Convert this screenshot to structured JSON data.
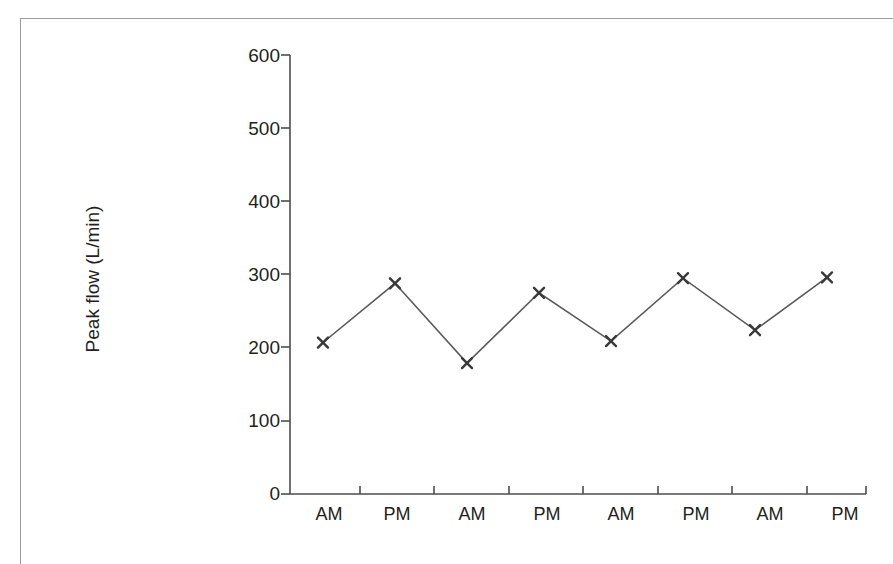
{
  "figure": {
    "ylabel": "Peak flow (L/min)",
    "xlabel": "",
    "title": "",
    "axis_color": "#4d4d4d",
    "series_color": "#595959",
    "marker": "x-cross",
    "frame_color": "#9a9a9a"
  },
  "axes": {
    "y_ticks": [
      "600",
      "500",
      "400",
      "300",
      "200",
      "100",
      "0"
    ],
    "x_ticks": [
      "AM",
      "PM",
      "AM",
      "PM",
      "AM",
      "PM",
      "AM",
      "PM"
    ]
  },
  "chart_data": {
    "type": "line",
    "title": "",
    "xlabel": "",
    "ylabel": "Peak flow (L/min)",
    "categories": [
      "AM",
      "PM",
      "AM",
      "PM",
      "AM",
      "PM",
      "AM",
      "PM"
    ],
    "values": [
      207,
      288,
      179,
      275,
      209,
      295,
      224,
      296
    ],
    "series": [
      {
        "name": "Peak flow",
        "values": [
          207,
          288,
          179,
          275,
          209,
          295,
          224,
          296
        ],
        "marker": "x",
        "color": "#595959"
      }
    ],
    "ylim": [
      0,
      600
    ],
    "ytick_values": [
      0,
      100,
      200,
      300,
      400,
      500,
      600
    ],
    "grid": false,
    "legend": "none"
  },
  "caption_sliver": "​"
}
